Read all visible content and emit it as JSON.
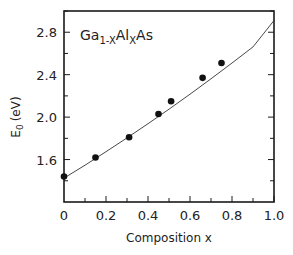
{
  "chart_data": {
    "type": "scatter",
    "title": "",
    "annotation": {
      "base": "Ga",
      "sub1": "1-X",
      "mid": "Al",
      "sub2": "X",
      "tail": "As"
    },
    "xlabel": "Composition x",
    "ylabel": {
      "main": "E",
      "sub": "0",
      "unit": "(eV)"
    },
    "xlim": [
      0,
      1.0
    ],
    "ylim": [
      1.2,
      3.0
    ],
    "xticks": [
      0,
      0.2,
      0.4,
      0.6,
      0.8,
      1.0
    ],
    "xtick_labels": [
      "0",
      "0.2",
      "0.4",
      "0.6",
      "0.8",
      "1.0"
    ],
    "yticks": [
      1.6,
      2.0,
      2.4,
      2.8
    ],
    "ytick_labels": [
      "1.6",
      "2.0",
      "2.4",
      "2.8"
    ],
    "grid": false,
    "legend": null,
    "series": [
      {
        "name": "measured",
        "type": "scatter",
        "x": [
          0.0,
          0.15,
          0.31,
          0.45,
          0.51,
          0.66,
          0.75
        ],
        "y": [
          1.44,
          1.62,
          1.81,
          2.03,
          2.15,
          2.37,
          2.51
        ]
      },
      {
        "name": "fit",
        "type": "line",
        "x": [
          0.0,
          0.1,
          0.2,
          0.3,
          0.4,
          0.5,
          0.6,
          0.7,
          0.8,
          0.9,
          1.0
        ],
        "y": [
          1.425,
          1.547,
          1.674,
          1.804,
          1.938,
          2.075,
          2.216,
          2.361,
          2.51,
          2.662,
          2.91
        ]
      }
    ]
  }
}
